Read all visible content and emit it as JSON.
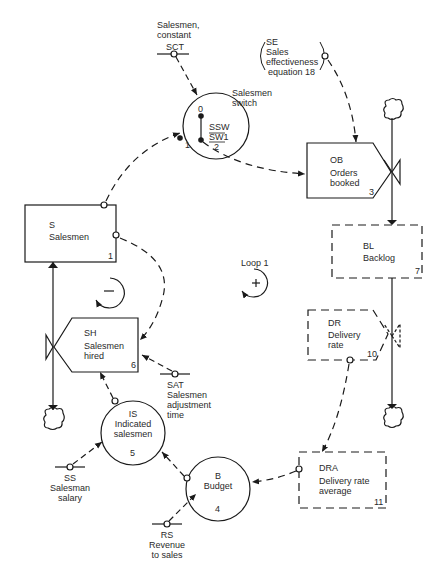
{
  "diagram": {
    "type": "system-dynamics flow diagram",
    "nodes": {
      "sct": {
        "code": "SCT",
        "line1": "Salesmen,",
        "line2": "constant"
      },
      "switch": {
        "title_line1": "Salesmen",
        "title_line2": "switch",
        "pos0": "0",
        "pos1": "1",
        "num_top": "SSW",
        "num_mid": "SW1",
        "num_bot": "2"
      },
      "se": {
        "code": "SE",
        "line1": "Sales",
        "line2": "effectiveness",
        "line3": "equation  18"
      },
      "ob": {
        "code": "OB",
        "line1": "Orders",
        "line2": "booked",
        "number": "3"
      },
      "s": {
        "code": "S",
        "line1": "Salesmen",
        "number": "1"
      },
      "loop_neg": {
        "sign": "−"
      },
      "loop1": {
        "label": "Loop 1",
        "sign": "+"
      },
      "bl": {
        "code": "BL",
        "line1": "Backlog",
        "number": "7"
      },
      "sh": {
        "code": "SH",
        "line1": "Salesmen",
        "line2": "hired",
        "number": "6"
      },
      "dr": {
        "code": "DR",
        "line1": "Delivery",
        "line2": "rate",
        "number": "10"
      },
      "sat": {
        "code": "SAT",
        "line1": "Salesmen",
        "line2": "adjustment",
        "line3": "time"
      },
      "is": {
        "code": "IS",
        "line1": "Indicated",
        "line2": "salesmen",
        "number": "5"
      },
      "b": {
        "code": "B",
        "line1": "Budget",
        "number": "4"
      },
      "dra": {
        "code": "DRA",
        "line1": "Delivery rate",
        "line2": "average",
        "number": "11"
      },
      "ss": {
        "code": "SS",
        "line1": "Salesman",
        "line2": "salary"
      },
      "rs": {
        "code": "RS",
        "line1": "Revenue",
        "line2": "to sales"
      }
    },
    "colors": {
      "ink": "#1a1a1a",
      "background": "#ffffff"
    }
  }
}
